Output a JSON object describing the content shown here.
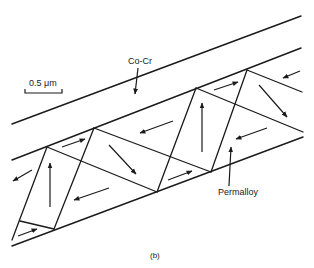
{
  "figure": {
    "caption": "(b)",
    "scale_bar": {
      "label": "0.5 μm"
    },
    "labels": {
      "cocr": "Co-Cr",
      "permalloy": "Permalloy"
    },
    "colors": {
      "ink": "#1a1a1a",
      "background": "#ffffff"
    }
  }
}
